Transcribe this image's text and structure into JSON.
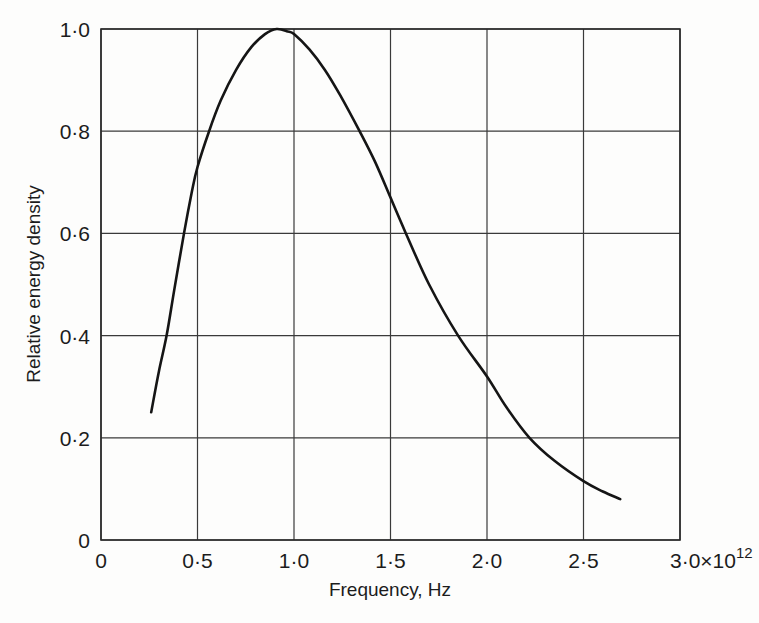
{
  "chart_data": {
    "type": "line",
    "title": "",
    "xlabel": "Frequency, Hz",
    "ylabel": "Relative energy density",
    "x_ticks": [
      "0",
      "0·5",
      "1·0",
      "1·5",
      "2·0",
      "2·5",
      "3·0×10"
    ],
    "x_tick_exponent": "12",
    "x_tick_values": [
      0,
      0.5,
      1.0,
      1.5,
      2.0,
      2.5,
      3.0
    ],
    "x_scale_note": "×10^12",
    "y_ticks": [
      "0",
      "0·2",
      "0·4",
      "0·6",
      "0·8",
      "1·0"
    ],
    "y_tick_values": [
      0,
      0.2,
      0.4,
      0.6,
      0.8,
      1.0
    ],
    "xlim": [
      0,
      3.0
    ],
    "ylim": [
      0,
      1.0
    ],
    "grid": true,
    "legend": null,
    "series": [
      {
        "name": "Relative energy density",
        "x": [
          0.26,
          0.3,
          0.34,
          0.38,
          0.43,
          0.47,
          0.5,
          0.56,
          0.62,
          0.7,
          0.78,
          0.85,
          0.91,
          0.97,
          1.0,
          1.08,
          1.16,
          1.24,
          1.34,
          1.42,
          1.5,
          1.58,
          1.7,
          1.85,
          2.0,
          2.1,
          2.22,
          2.35,
          2.5,
          2.6,
          2.69
        ],
        "y": [
          0.25,
          0.33,
          0.4,
          0.49,
          0.6,
          0.68,
          0.73,
          0.8,
          0.86,
          0.92,
          0.965,
          0.99,
          1.0,
          0.995,
          0.99,
          0.96,
          0.92,
          0.87,
          0.8,
          0.74,
          0.67,
          0.6,
          0.5,
          0.4,
          0.32,
          0.26,
          0.2,
          0.155,
          0.115,
          0.095,
          0.08
        ]
      }
    ]
  }
}
